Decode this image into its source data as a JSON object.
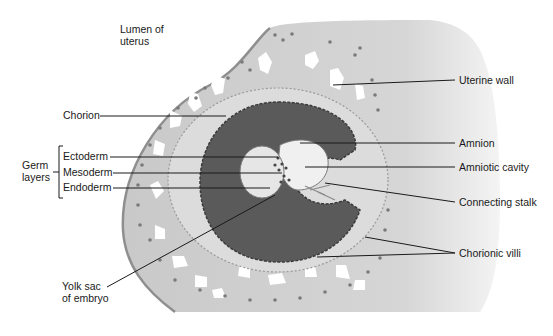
{
  "diagram": {
    "type": "anatomical-cross-section",
    "colors": {
      "uterine_tissue": "#c9c9c9",
      "uterine_wall_fade": "#e2e2e2",
      "lacunae": "#ffffff",
      "chorion_band": "#dcdcdc",
      "chorionic_cavity": "#5a5a5a",
      "amniotic_cavity": "#f0f0f0",
      "yolk_sac": "#e6e6e6",
      "cells": "#7a7a7a",
      "label_text": "#1a1a1a"
    }
  },
  "labels": {
    "lumen": {
      "line1": "Lumen of",
      "line2": "uterus"
    },
    "uterine_wall": "Uterine wall",
    "chorion": "Chorion",
    "amnion": "Amnion",
    "amniotic_cavity": "Amniotic cavity",
    "connecting_stalk": "Connecting stalk",
    "chorionic_villi": "Chorionic villi",
    "yolk_sac": {
      "line1": "Yolk sac",
      "line2": "of embryo"
    },
    "germ_layers": {
      "group": {
        "line1": "Germ",
        "line2": "layers"
      },
      "items": [
        "Ectoderm",
        "Mesoderm",
        "Endoderm"
      ]
    }
  }
}
